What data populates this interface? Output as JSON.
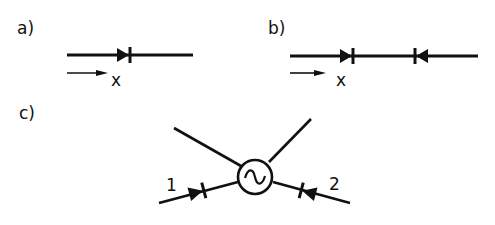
{
  "panels": {
    "a": {
      "label": "a)",
      "axis_label": "x",
      "description": "single forward diode on a line",
      "diodes": [
        {
          "direction": "right"
        }
      ]
    },
    "b": {
      "label": "b)",
      "axis_label": "x",
      "description": "two opposing diodes on a line",
      "diodes": [
        {
          "direction": "right"
        },
        {
          "direction": "left"
        }
      ]
    },
    "c": {
      "label": "c)",
      "center_symbol": "~",
      "port_labels": [
        "1",
        "2"
      ],
      "description": "two diodes pointing into an AC source node with two outgoing lines"
    }
  },
  "colors": {
    "ink": "#111111",
    "background": "#ffffff"
  }
}
